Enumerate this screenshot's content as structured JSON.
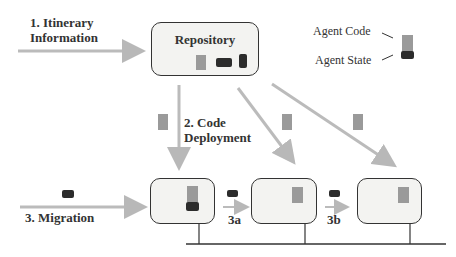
{
  "labels": {
    "itinerary": [
      "1. Itinerary",
      "Information"
    ],
    "repository": "Repository",
    "agent_code": "Agent Code",
    "agent_state": "Agent State",
    "code_deployment": [
      "2. Code",
      "Deployment"
    ],
    "migration": "3. Migration",
    "step_3a": "3a",
    "step_3b": "3b"
  },
  "colors": {
    "agent_code": "#9a9a9a",
    "agent_state": "#2c2c2c",
    "arrow": "#b8b8b8",
    "box_border": "#333333",
    "box_fill": "#f3f3f1"
  },
  "nodes": [
    {
      "id": "host-1",
      "contains": [
        "agent_code",
        "agent_state"
      ]
    },
    {
      "id": "host-2",
      "contains": [
        "agent_code"
      ]
    },
    {
      "id": "host-3",
      "contains": [
        "agent_code"
      ]
    }
  ]
}
